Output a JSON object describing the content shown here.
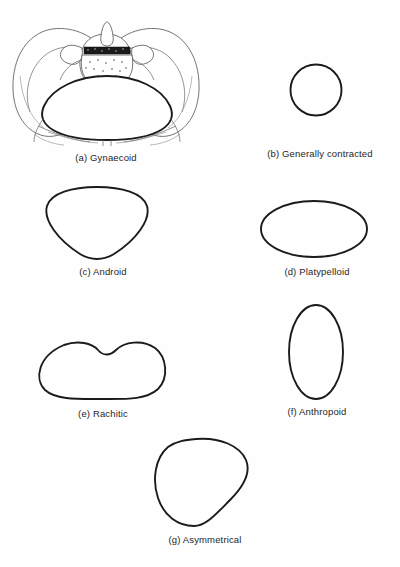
{
  "figure": {
    "background_color": "#ffffff",
    "outline_color": "#1b1b1b",
    "bone_line_color": "#5b5b5b",
    "caption_color": "#262626"
  },
  "panels": [
    {
      "key": "a",
      "label": "(a) Gynaecoid",
      "shape": "anatomical-pelvis-with-rounded-oval-brim",
      "icon": "pelvis-gynaecoid-icon"
    },
    {
      "key": "b",
      "label": "(b) Generally contracted",
      "shape": "small-circle",
      "icon": "brim-circle-icon"
    },
    {
      "key": "c",
      "label": "(c) Android",
      "shape": "heart-shaped-wedge",
      "icon": "brim-android-icon"
    },
    {
      "key": "d",
      "label": "(d) Platypelloid",
      "shape": "wide-flat-ellipse",
      "icon": "brim-platypelloid-icon"
    },
    {
      "key": "e",
      "label": "(e) Rachitic",
      "shape": "kidney-bean-with-top-notch",
      "icon": "brim-rachitic-icon"
    },
    {
      "key": "f",
      "label": "(f) Anthropoid",
      "shape": "tall-vertical-oval",
      "icon": "brim-anthropoid-icon"
    },
    {
      "key": "g",
      "label": "(g) Asymmetrical",
      "shape": "lopsided-teardrop",
      "icon": "brim-asymmetrical-icon"
    }
  ]
}
